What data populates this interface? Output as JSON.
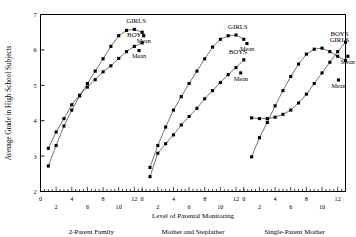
{
  "chart_data": {
    "type": "line",
    "title": "",
    "xlabel": "Level of Parental Monitoring",
    "ylabel": "Average Grade in High School Subjects",
    "ylim": [
      2,
      7
    ],
    "yticks": [
      2,
      3,
      4,
      5,
      6,
      7
    ],
    "xlim": [
      0,
      13
    ],
    "xticks_major": [
      0,
      2,
      4,
      6,
      8,
      10,
      12
    ],
    "xticks_upper_row": [
      0,
      4,
      8,
      12
    ],
    "xticks_lower_row": [
      2,
      6,
      10
    ],
    "grid": false,
    "legend_position": "inline-annotations",
    "marker": "filled-square",
    "panels": [
      {
        "name": "2-Parent Family",
        "label": "2-Parent Family",
        "series": [
          {
            "name": "BOYS",
            "label": "BOYS",
            "x": [
              1,
              2,
              3,
              4,
              5,
              6,
              7,
              8,
              9,
              10,
              11,
              12,
              13
            ],
            "y": [
              3.22,
              3.68,
              4.06,
              4.45,
              4.72,
              4.95,
              5.16,
              5.38,
              5.55,
              5.76,
              5.95,
              6.1,
              6.2
            ],
            "mean_label": "Mean",
            "mean_x": 12.6,
            "mean_y": 5.98
          },
          {
            "name": "GIRLS",
            "label": "GIRLS",
            "x": [
              1,
              2,
              3,
              4,
              5,
              6,
              7,
              8,
              9,
              10,
              11,
              12,
              13
            ],
            "y": [
              2.72,
              3.3,
              3.85,
              4.3,
              4.7,
              5.05,
              5.4,
              5.75,
              6.1,
              6.4,
              6.55,
              6.58,
              6.5
            ],
            "mean_label": "Mean",
            "mean_x": 13.2,
            "mean_y": 6.4
          }
        ]
      },
      {
        "name": "Mother and Stepfather",
        "label": "Mother and Stepfather",
        "series": [
          {
            "name": "BOYS",
            "label": "BOYS",
            "x": [
              1,
              2,
              3,
              4,
              5,
              6,
              7,
              8,
              9,
              10,
              11,
              12,
              13
            ],
            "y": [
              2.42,
              3.08,
              3.35,
              3.6,
              3.88,
              4.12,
              4.35,
              4.62,
              4.85,
              5.08,
              5.3,
              5.5,
              5.72
            ],
            "mean_label": "Mean",
            "mean_x": 12.6,
            "mean_y": 5.35
          },
          {
            "name": "GIRLS",
            "label": "GIRLS",
            "x": [
              1,
              2,
              3,
              4,
              5,
              6,
              7,
              8,
              9,
              10,
              11,
              12,
              13
            ],
            "y": [
              2.68,
              3.3,
              3.82,
              4.3,
              4.68,
              5.05,
              5.4,
              5.75,
              6.08,
              6.3,
              6.4,
              6.42,
              6.3
            ],
            "mean_label": "Mean",
            "mean_x": 13.4,
            "mean_y": 6.18
          }
        ]
      },
      {
        "name": "Single-Parent Mother",
        "label": "Single-Parent Mother",
        "series": [
          {
            "name": "BOYS",
            "label": "BOYS",
            "x": [
              1,
              2,
              3,
              4,
              5,
              6,
              7,
              8,
              9,
              10,
              11,
              12,
              13
            ],
            "y": [
              4.08,
              4.06,
              4.06,
              4.1,
              4.18,
              4.3,
              4.5,
              4.75,
              5.05,
              5.35,
              5.65,
              5.95,
              6.22
            ],
            "mean_label": "Mean",
            "mean_x": 12.1,
            "mean_y": 5.15
          },
          {
            "name": "GIRLS",
            "label": "GIRLS",
            "x": [
              1,
              2,
              3,
              4,
              5,
              6,
              7,
              8,
              9,
              10,
              11,
              12,
              13
            ],
            "y": [
              2.98,
              3.52,
              3.95,
              4.42,
              4.85,
              5.25,
              5.6,
              5.88,
              6.02,
              6.05,
              5.95,
              5.82,
              5.7
            ],
            "mean_label": "Mean",
            "mean_x": 13.3,
            "mean_y": 5.82
          }
        ]
      }
    ]
  },
  "axis": {
    "y_title": "Average Grade in High School Subjects",
    "x_title": "Level of Parental Monitoring",
    "y_tick_labels": [
      "7",
      "6",
      "5",
      "4",
      "3",
      "2"
    ],
    "x_tick_labels_upper": [
      "0",
      "4",
      "8",
      "12"
    ],
    "x_tick_labels_lower": [
      "2",
      "6",
      "10"
    ]
  },
  "annotations": {
    "boys": "BOYS",
    "girls": "GIRLS",
    "mean": "Mean"
  },
  "panel_labels": [
    "2-Parent Family",
    "Mother and Stepfather",
    "Single-Parent Mother"
  ],
  "colors": {
    "ink": "#000000",
    "background": "#ffffff"
  }
}
